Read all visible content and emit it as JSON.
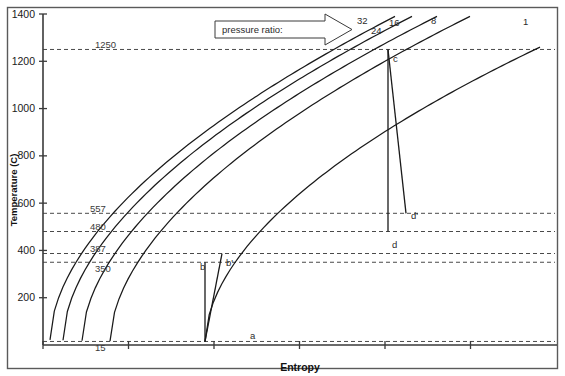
{
  "chart_data": {
    "type": "line",
    "title": "",
    "xlabel": "Entropy",
    "ylabel": "Temperature (C)",
    "ylim": [
      0,
      1400
    ],
    "y_ticks": [
      200,
      400,
      600,
      800,
      1000,
      1200,
      1400
    ],
    "y_tick_labels": [
      "200",
      "400",
      "600",
      "800",
      "1000",
      "1200",
      "1400"
    ],
    "x_ticks_unlabeled": 6,
    "grid": false,
    "legend_note": "pressure ratio:",
    "series_label_title": "pressure ratio",
    "series": [
      {
        "name": "32",
        "label": "32",
        "pressure_ratio": 32
      },
      {
        "name": "24",
        "label": "24",
        "pressure_ratio": 24
      },
      {
        "name": "16",
        "label": "16",
        "pressure_ratio": 16
      },
      {
        "name": "8",
        "label": "8",
        "pressure_ratio": 8
      },
      {
        "name": "1",
        "label": "1",
        "pressure_ratio": 1
      }
    ],
    "reference_lines": [
      {
        "value": 1250,
        "label": "1250"
      },
      {
        "value": 557,
        "label": "557"
      },
      {
        "value": 480,
        "label": "480"
      },
      {
        "value": 387,
        "label": "387"
      },
      {
        "value": 350,
        "label": "350"
      },
      {
        "value": 15,
        "label": "15"
      }
    ],
    "state_points": [
      {
        "label": "a",
        "temperature": 15
      },
      {
        "label": "b",
        "temperature": 350
      },
      {
        "label": "b'",
        "temperature": 387
      },
      {
        "label": "c",
        "temperature": 1250
      },
      {
        "label": "d",
        "temperature": 480
      },
      {
        "label": "d'",
        "temperature": 557
      }
    ],
    "colors": {
      "axis": "#3a3a3a",
      "curve": "#1a1a1a",
      "dashed": "#4a4a4a",
      "label": "#2b2b2b",
      "background": "#ffffff"
    }
  },
  "axes": {
    "ylabel": "Temperature (C)",
    "xlabel": "Entropy"
  },
  "annotations": {
    "pressure_ratio_box": "pressure ratio:"
  }
}
